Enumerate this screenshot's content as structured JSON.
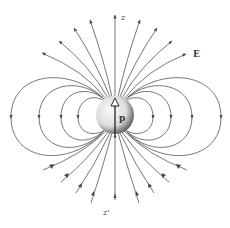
{
  "diagram": {
    "labels": {
      "z_axis_top": "z",
      "z_axis_bottom": "z'",
      "field": "E",
      "dipole": "p"
    },
    "center": [
      115,
      115
    ],
    "sphere_radius": 19,
    "colors": {
      "line": "#555555",
      "label": "#333333",
      "sphere_light": "#f4f4f4",
      "sphere_dark": "#222222"
    },
    "loop_half_widths": [
      37,
      54,
      76,
      104
    ],
    "loop_side_x_left": [
      78,
      61,
      39,
      11
    ],
    "loop_side_x_right": [
      153,
      171,
      192,
      221
    ],
    "top_line_endpoints": [
      [
        115,
        15
      ],
      [
        90,
        20
      ],
      [
        74,
        28
      ],
      [
        59,
        41
      ],
      [
        42,
        53
      ],
      [
        140,
        20
      ],
      [
        157,
        28
      ],
      [
        172,
        41
      ],
      [
        186,
        54
      ]
    ],
    "bottom_line_endpoints": [
      [
        115,
        200
      ],
      [
        91,
        203
      ],
      [
        76,
        193
      ],
      [
        61,
        182
      ],
      [
        43,
        170
      ],
      [
        139,
        203
      ],
      [
        154,
        193
      ],
      [
        169,
        182
      ],
      [
        187,
        170
      ]
    ]
  }
}
